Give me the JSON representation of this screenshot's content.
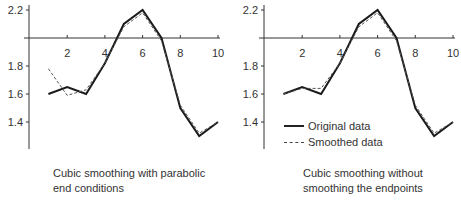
{
  "chart_data": [
    {
      "type": "line",
      "title": "",
      "caption": [
        "Cubic smoothing with parabolic",
        "end conditions"
      ],
      "xlabel": "",
      "ylabel": "",
      "x": [
        1,
        2,
        3,
        4,
        5,
        6,
        7,
        8,
        9,
        10
      ],
      "x_ticks": [
        "2",
        "4",
        "6",
        "8",
        "10"
      ],
      "y_ticks": [
        "2.2",
        "1.8",
        "1.6",
        "1.4"
      ],
      "ylim": [
        1.25,
        2.25
      ],
      "xaxis_crosses_y_at": 2.0,
      "grid": false,
      "series": [
        {
          "name": "Original data",
          "style": "solid",
          "values": [
            1.6,
            1.65,
            1.6,
            1.82,
            2.1,
            2.2,
            2.0,
            1.5,
            1.3,
            1.4
          ]
        },
        {
          "name": "Smoothed data",
          "style": "dashed",
          "values": [
            1.78,
            1.59,
            1.63,
            1.82,
            2.08,
            2.18,
            1.98,
            1.52,
            1.32,
            1.4
          ]
        }
      ]
    },
    {
      "type": "line",
      "title": "",
      "caption": [
        "Cubic smoothing without",
        "smoothing the endpoints"
      ],
      "xlabel": "",
      "ylabel": "",
      "x": [
        1,
        2,
        3,
        4,
        5,
        6,
        7,
        8,
        9,
        10
      ],
      "x_ticks": [
        "2",
        "4",
        "6",
        "8",
        "10"
      ],
      "y_ticks": [
        "2.2",
        "1.8",
        "1.6",
        "1.4"
      ],
      "ylim": [
        1.25,
        2.25
      ],
      "xaxis_crosses_y_at": 2.0,
      "grid": false,
      "legend": {
        "position": "lower-left",
        "entries": [
          "Original data",
          "Smoothed data"
        ]
      },
      "series": [
        {
          "name": "Original data",
          "style": "solid",
          "values": [
            1.6,
            1.65,
            1.6,
            1.82,
            2.1,
            2.2,
            2.0,
            1.5,
            1.3,
            1.4
          ]
        },
        {
          "name": "Smoothed data",
          "style": "dashed",
          "values": [
            1.6,
            1.64,
            1.64,
            1.82,
            2.08,
            2.18,
            1.98,
            1.52,
            1.32,
            1.4
          ]
        }
      ]
    }
  ],
  "left": {
    "caption_line1": "Cubic smoothing with parabolic",
    "caption_line2": "end conditions"
  },
  "right": {
    "caption_line1": "Cubic smoothing without",
    "caption_line2": "smoothing the endpoints",
    "legend_original": "Original data",
    "legend_smoothed": "Smoothed data"
  }
}
